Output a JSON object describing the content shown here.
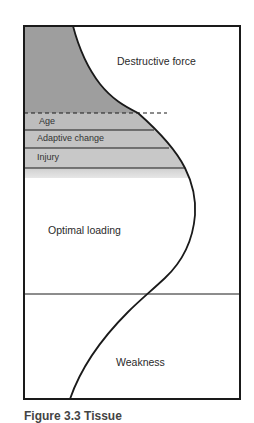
{
  "diagram": {
    "regions": {
      "destructive_force": "Destructive force",
      "optimal_loading": "Optimal loading",
      "weakness": "Weakness"
    },
    "bands": [
      {
        "label": "Age"
      },
      {
        "label": "Adaptive change"
      },
      {
        "label": "Injury"
      }
    ],
    "colors": {
      "dark_shade": "#9e9e9e",
      "band_shade": "#c2c2c2",
      "light_shade": "#d6d6d6",
      "line": "#1a1a1a"
    }
  },
  "caption": {
    "text": "Figure 3.3  Tissue"
  }
}
